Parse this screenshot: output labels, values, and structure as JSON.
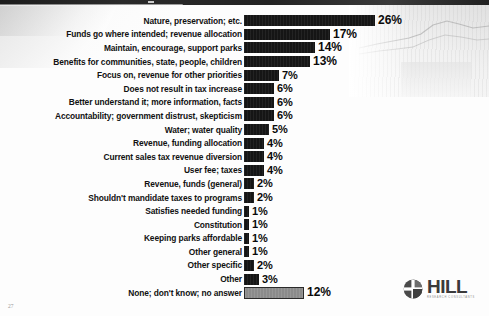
{
  "slide": {
    "page_number": "27"
  },
  "logo": {
    "brand": "HILL",
    "tagline": "RESEARCH CONSULTANTS",
    "mark_icon": "hill-globe-cross-icon"
  },
  "chart_data": {
    "type": "bar",
    "orientation": "horizontal",
    "title": "",
    "xlabel": "",
    "ylabel": "",
    "grid": false,
    "legend": false,
    "xlim": [
      0,
      26
    ],
    "value_suffix": "%",
    "categories": [
      "Nature, preservation; etc.",
      "Funds go where intended; revenue allocation",
      "Maintain, encourage, support parks",
      "Benefits for communities, state, people, children",
      "Focus on, revenue for other priorities",
      "Does not result in tax increase",
      "Better understand it; more information, facts",
      "Accountability; government distrust, skepticism",
      "Water; water quality",
      "Revenue, funding allocation",
      "Current sales tax revenue diversion",
      "User fee; taxes",
      "Revenue, funds (general)",
      "Shouldn't mandidate taxes to programs",
      "Satisfies needed funding",
      "Constitution",
      "Keeping parks affordable",
      "Other general",
      "Other specific",
      "Other",
      "None; don't know; no answer"
    ],
    "values": [
      26,
      17,
      14,
      13,
      7,
      6,
      6,
      6,
      5,
      4,
      4,
      4,
      2,
      2,
      1,
      1,
      1,
      1,
      2,
      3,
      12
    ],
    "value_labels": [
      "26%",
      "17%",
      "14%",
      "13%",
      "7%",
      "6%",
      "6%",
      "6%",
      "5%",
      "4%",
      "4%",
      "4%",
      "2%",
      "2%",
      "1%",
      "1%",
      "1%",
      "1%",
      "2%",
      "3%",
      "12%"
    ],
    "bar_styles": [
      "dark",
      "dark",
      "dark",
      "dark",
      "dark",
      "dark",
      "dark",
      "dark",
      "dark",
      "dark",
      "dark",
      "dark",
      "dark",
      "dark",
      "dark",
      "dark",
      "dark",
      "dark",
      "dark",
      "dark",
      "grey"
    ],
    "colors": {
      "bar_dark": "#151515",
      "bar_grey": "#8b8b8b",
      "label": "#111111"
    }
  }
}
